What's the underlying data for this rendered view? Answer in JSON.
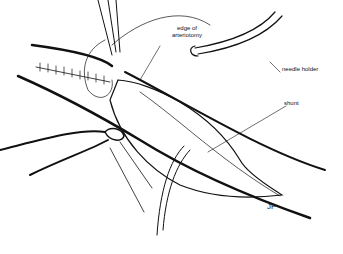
{
  "figure": {
    "type": "surgical line illustration",
    "labels": {
      "edge": "edge of\narteriotomy",
      "edge_line1": "edge of",
      "edge_line2": "arteriotomy",
      "needle_holder": "needle holder",
      "shunt": "shunt",
      "signature": "JF"
    },
    "colors": {
      "ink": "#111111",
      "background": "#ffffff"
    }
  }
}
